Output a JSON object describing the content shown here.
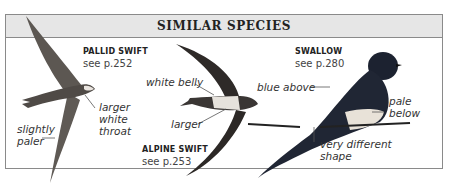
{
  "panel": {
    "title": "SIMILAR SPECIES"
  },
  "species": [
    {
      "name": "PALLID SWIFT",
      "ref": "see p.252",
      "notes": [
        "larger white throat",
        "slightly paler"
      ],
      "notes_lines": {
        "throat": [
          "larger",
          "white",
          "throat"
        ],
        "paler": [
          "slightly",
          "paler"
        ]
      }
    },
    {
      "name": "ALPINE SWIFT",
      "ref": "see p.253",
      "notes_lines": {
        "belly": [
          "white belly"
        ],
        "larger": [
          "larger"
        ]
      }
    },
    {
      "name": "SWALLOW",
      "ref": "see p.280",
      "notes_lines": {
        "blue": [
          "blue above"
        ],
        "pale": [
          "pale",
          "below"
        ],
        "shape": [
          "very different",
          "shape"
        ]
      }
    }
  ],
  "colors": {
    "header_bg": "#e6e6e6",
    "border": "#8a8a8a",
    "swift_dark": "#3a3a3a",
    "pallid": "#6b6560",
    "swallow_blue": "#1c2230",
    "swallow_belly": "#e8e2d8"
  }
}
